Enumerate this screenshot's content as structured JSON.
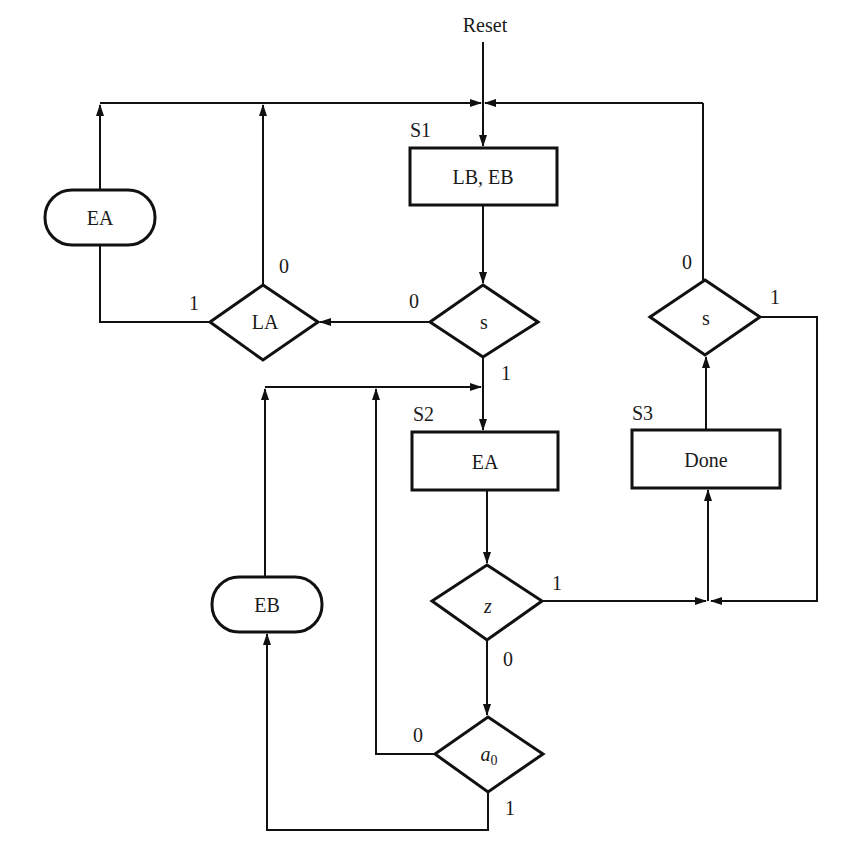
{
  "diagram": {
    "type": "ASM chart",
    "reset_label": "Reset",
    "states": [
      {
        "name": "S1",
        "output": "LB, EB"
      },
      {
        "name": "S2",
        "output": "EA"
      },
      {
        "name": "S3",
        "output": "Done"
      }
    ],
    "decisions": [
      {
        "id": "s_top",
        "condition": "s",
        "branch_0": "0",
        "branch_1": "1"
      },
      {
        "id": "la",
        "condition": "LA",
        "branch_0": "0",
        "branch_1": "1"
      },
      {
        "id": "s_right",
        "condition": "s",
        "branch_0": "0",
        "branch_1": "1"
      },
      {
        "id": "z",
        "condition": "z",
        "branch_0": "0",
        "branch_1": "1"
      },
      {
        "id": "a0",
        "condition_base": "a",
        "condition_sub": "0",
        "branch_0": "0",
        "branch_1": "1"
      }
    ],
    "conditional_outputs": [
      {
        "id": "ea_cond",
        "label": "EA"
      },
      {
        "id": "eb_cond",
        "label": "EB"
      }
    ]
  }
}
